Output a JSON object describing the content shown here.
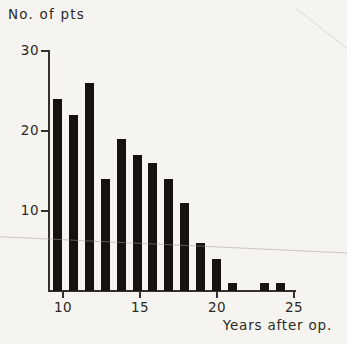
{
  "page": {
    "background": "#f5f4f0"
  },
  "chart_data": {
    "type": "bar",
    "ylabel": "No. of pts",
    "xlabel": "Years after op.",
    "categories": [
      10,
      11,
      12,
      13,
      14,
      15,
      16,
      17,
      18,
      19,
      20,
      21,
      23,
      24
    ],
    "values": [
      24,
      22,
      26,
      14,
      19,
      17,
      16,
      14,
      11,
      6,
      4,
      1,
      1,
      1
    ],
    "x_ticks": [
      10,
      15,
      20,
      25
    ],
    "y_ticks": [
      10,
      20,
      30
    ],
    "ylim": [
      0,
      30
    ],
    "xlim": [
      9,
      25
    ],
    "grid": false,
    "legend": null,
    "bar_color": "#16130f",
    "axis_color": "#35312b",
    "text_color": "#2d2a25",
    "background_color": "#f5f4f0"
  }
}
